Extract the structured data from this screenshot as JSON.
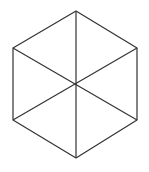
{
  "diagram": {
    "shape": "regular hexagon divided into six triangles",
    "stroke_color": "#333333",
    "background": "#ffffff",
    "vertices": {
      "top": [
        76,
        11
      ],
      "upper_right": [
        137,
        48
      ],
      "lower_right": [
        137,
        120
      ],
      "bottom": [
        76,
        158
      ],
      "lower_left": [
        13,
        120
      ],
      "upper_left": [
        13,
        48
      ]
    },
    "center": [
      76,
      85
    ]
  }
}
